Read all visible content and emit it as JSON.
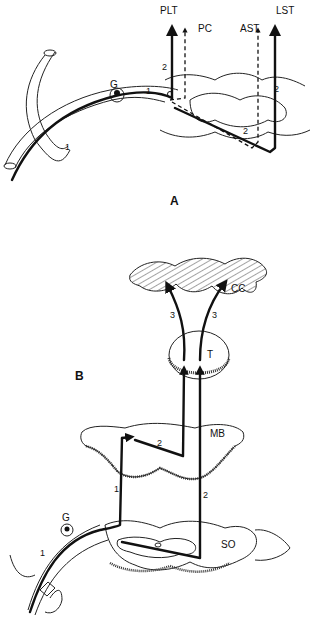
{
  "panels": {
    "A": {
      "label": "A",
      "tracts": {
        "plt": "PLT",
        "pc": "PC",
        "ast": "AST",
        "lst": "LST"
      },
      "ganglion": "G",
      "neuron_numbers": {
        "first_order_root": "1",
        "first_order_ganglion": "1",
        "second_order_plt": "2",
        "second_order_cross": "2",
        "second_order_lst": "2"
      }
    },
    "B": {
      "label": "B",
      "structures": {
        "cortex": "CC",
        "thalamus": "T",
        "midbrain": "MB",
        "spinal": "SO"
      },
      "ganglion": "G",
      "neuron_numbers": {
        "first_order_root": "1",
        "first_order_ascending": "1",
        "second_order_mb": "2",
        "second_order_ascending": "2",
        "third_order_left": "3",
        "third_order_right": "3"
      }
    }
  }
}
